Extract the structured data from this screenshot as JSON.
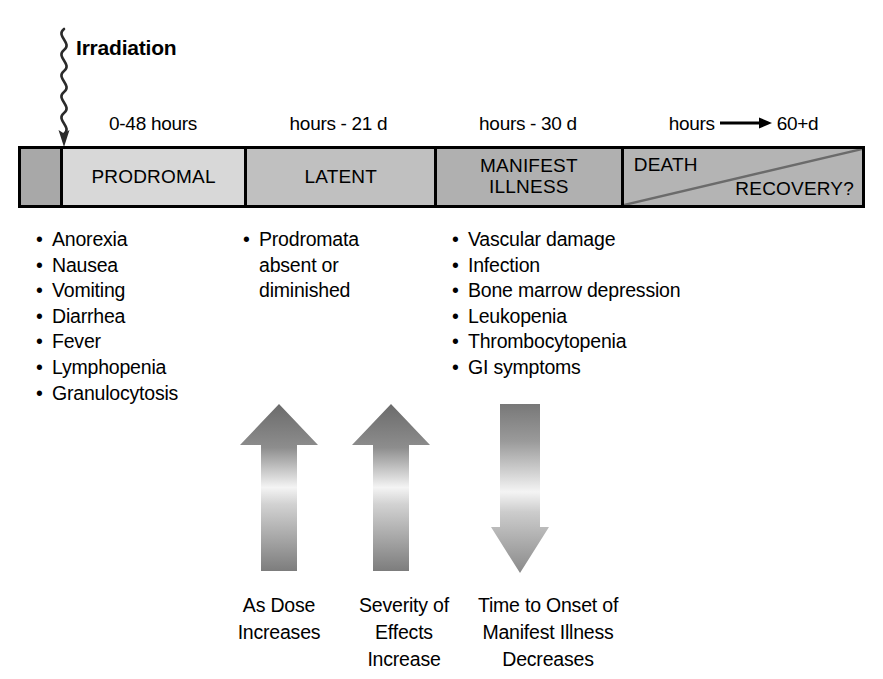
{
  "figure": {
    "irradiation_label": "Irradiation",
    "squiggle_icon": "squiggly-radiation-arrow-icon"
  },
  "timeline": {
    "time_labels": [
      "0-48  hours",
      "hours  -  21  d",
      "hours  -  30  d",
      "hours"
    ],
    "time_label_last_suffix": "60+d",
    "time_label_last_arrow_icon": "long-right-arrow-icon",
    "phases": [
      {
        "label": "",
        "color": "#a8a8a8"
      },
      {
        "label": "PRODROMAL",
        "color": "#d8d8d8"
      },
      {
        "label": "LATENT",
        "color": "#c0c0c0"
      },
      {
        "label": "MANIFEST\nILLNESS",
        "line1": "MANIFEST",
        "line2": "ILLNESS",
        "color": "#b0b0b0"
      },
      {
        "label": "DEATH / RECOVERY?",
        "color": "#b4b4b4"
      }
    ],
    "outcome": {
      "death_label": "DEATH",
      "recovery_label": "RECOVERY?",
      "divider_icon": "diagonal-split-line-icon"
    }
  },
  "symptoms": {
    "prodromal": [
      "Anorexia",
      "Nausea",
      "Vomiting",
      "Diarrhea",
      "Fever",
      "Lymphopenia",
      "Granulocytosis"
    ],
    "latent_bullet": "Prodromata",
    "latent_cont_1": "absent  or",
    "latent_cont_2": "diminished",
    "manifest": [
      "Vascular damage",
      "Infection",
      "Bone marrow depression",
      "Leukopenia",
      "Thrombocytopenia",
      "GI symptoms"
    ],
    "bullet_glyph": "•"
  },
  "trends": [
    {
      "icon": "up-arrow-icon",
      "direction": "up",
      "caption_line1": "As Dose",
      "caption_line2": "Increases",
      "caption_line3": ""
    },
    {
      "icon": "up-arrow-icon",
      "direction": "up",
      "caption_line1": "Severity of",
      "caption_line2": "Effects",
      "caption_line3": "Increase"
    },
    {
      "icon": "down-arrow-icon",
      "direction": "down",
      "caption_line1": "Time to Onset of",
      "caption_line2": "Manifest Illness",
      "caption_line3": "Decreases"
    }
  ],
  "colors": {
    "ink": "#000000",
    "background": "#ffffff",
    "arrow_dark": "#6e6e6e",
    "arrow_light": "#f2f2f2"
  }
}
